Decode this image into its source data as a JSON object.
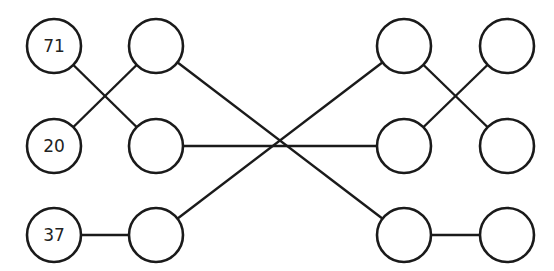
{
  "diagram": {
    "type": "switching-network",
    "columns": 4,
    "rows": 3,
    "nodes": [
      {
        "id": "c1r1",
        "col": 1,
        "row": 1,
        "x": 54,
        "y": 46,
        "label": "71"
      },
      {
        "id": "c1r2",
        "col": 1,
        "row": 2,
        "x": 54,
        "y": 146,
        "label": "20"
      },
      {
        "id": "c1r3",
        "col": 1,
        "row": 3,
        "x": 54,
        "y": 235,
        "label": "37"
      },
      {
        "id": "c2r1",
        "col": 2,
        "row": 1,
        "x": 156,
        "y": 46,
        "label": ""
      },
      {
        "id": "c2r2",
        "col": 2,
        "row": 2,
        "x": 156,
        "y": 146,
        "label": ""
      },
      {
        "id": "c2r3",
        "col": 2,
        "row": 3,
        "x": 156,
        "y": 235,
        "label": ""
      },
      {
        "id": "c3r1",
        "col": 3,
        "row": 1,
        "x": 404,
        "y": 46,
        "label": ""
      },
      {
        "id": "c3r2",
        "col": 3,
        "row": 2,
        "x": 404,
        "y": 146,
        "label": ""
      },
      {
        "id": "c3r3",
        "col": 3,
        "row": 3,
        "x": 404,
        "y": 235,
        "label": ""
      },
      {
        "id": "c4r1",
        "col": 4,
        "row": 1,
        "x": 507,
        "y": 46,
        "label": ""
      },
      {
        "id": "c4r2",
        "col": 4,
        "row": 2,
        "x": 507,
        "y": 146,
        "label": ""
      },
      {
        "id": "c4r3",
        "col": 4,
        "row": 3,
        "x": 507,
        "y": 235,
        "label": ""
      }
    ],
    "edges": [
      {
        "from": "c1r1",
        "to": "c2r2"
      },
      {
        "from": "c1r2",
        "to": "c2r1"
      },
      {
        "from": "c1r3",
        "to": "c2r3"
      },
      {
        "from": "c2r1",
        "to": "c3r3"
      },
      {
        "from": "c2r2",
        "to": "c3r2"
      },
      {
        "from": "c2r3",
        "to": "c3r1"
      },
      {
        "from": "c3r1",
        "to": "c4r2"
      },
      {
        "from": "c3r2",
        "to": "c4r1"
      },
      {
        "from": "c3r3",
        "to": "c4r3"
      }
    ],
    "node_radius": 27,
    "stroke_color": "#1a1a1a"
  }
}
